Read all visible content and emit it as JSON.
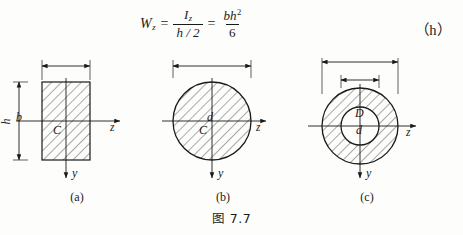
{
  "formula": {
    "lhs_symbol": "W",
    "lhs_sub": "z",
    "equals_1": "=",
    "frac1_num_symbol": "I",
    "frac1_num_sub": "z",
    "frac1_den": "h / 2",
    "equals_2": "=",
    "frac2_num": "bh",
    "frac2_num_sup": "2",
    "frac2_den": "6",
    "equation_label": "（h）"
  },
  "figures": [
    {
      "id": "a",
      "shape": "rectangle",
      "sublabel": "(a)",
      "dim_top": "b",
      "dim_left": "h",
      "centroid": "C",
      "axis_z": "z",
      "axis_y": "y",
      "hatched": true
    },
    {
      "id": "b",
      "shape": "circle",
      "sublabel": "(b)",
      "dim_top": "d",
      "centroid": "C",
      "axis_z": "z",
      "axis_y": "y",
      "hatched": true
    },
    {
      "id": "c",
      "shape": "annulus",
      "sublabel": "(c)",
      "dim_outer": "D",
      "dim_inner": "d",
      "axis_z": "z",
      "axis_y": "y",
      "hatched": true
    }
  ],
  "caption": "图 7.7",
  "colors": {
    "ink": "#1a1a1a",
    "background": "#fdfdfb",
    "hatch": "#2a2a2a"
  }
}
